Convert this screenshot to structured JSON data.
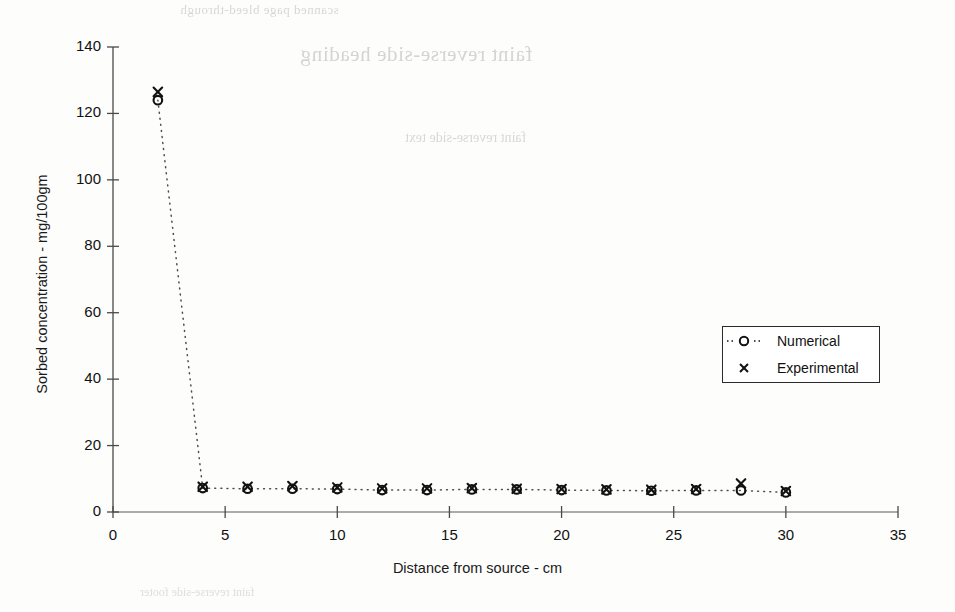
{
  "page": {
    "background_color": "#fdfdfc",
    "ink_color": "#111111",
    "ghost_text": {
      "line1": "scanned page bleed-through",
      "line2": "faint reverse-side heading",
      "line3": "faint reverse-side text",
      "line4": "faint reverse-side footer"
    }
  },
  "chart_data": {
    "type": "scatter",
    "title": "",
    "xlabel": "Distance from source  -  cm",
    "ylabel": "Sorbed concentration  -  mg/100gm",
    "xlim": [
      0,
      35
    ],
    "ylim": [
      0,
      140
    ],
    "xticks": [
      0,
      5,
      10,
      15,
      20,
      25,
      30,
      35
    ],
    "yticks": [
      0,
      20,
      40,
      60,
      80,
      100,
      120,
      140
    ],
    "xtick_labels": [
      "0",
      "5",
      "10",
      "15",
      "20",
      "25",
      "30",
      "35"
    ],
    "ytick_labels": [
      "0",
      "20",
      "40",
      "60",
      "80",
      "100",
      "120",
      "140"
    ],
    "grid": false,
    "legend_position": "upper right",
    "x": [
      2,
      4,
      6,
      8,
      10,
      12,
      14,
      16,
      18,
      20,
      22,
      24,
      26,
      28,
      30
    ],
    "series": [
      {
        "name": "Numerical",
        "marker": "circle-open",
        "line": "dotted",
        "color": "#111111",
        "values": [
          124.0,
          7.2,
          7.0,
          7.0,
          6.9,
          6.6,
          6.6,
          6.8,
          6.8,
          6.6,
          6.5,
          6.4,
          6.5,
          6.5,
          5.9
        ]
      },
      {
        "name": "Experimental",
        "marker": "x",
        "line": "none",
        "color": "#111111",
        "values": [
          126.5,
          7.6,
          7.6,
          7.8,
          7.4,
          7.1,
          7.1,
          7.2,
          7.0,
          6.9,
          6.8,
          6.7,
          6.9,
          8.6,
          6.3
        ]
      }
    ]
  },
  "legend": {
    "entries": [
      {
        "label": "Numerical",
        "marker": "circle-open"
      },
      {
        "label": "Experimental",
        "marker": "x"
      }
    ]
  }
}
